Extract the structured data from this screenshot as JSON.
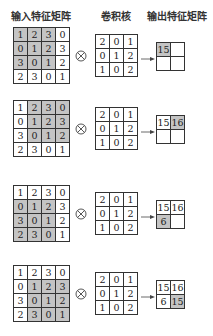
{
  "headers": {
    "input": "输入特征矩阵",
    "kernel": "卷积核",
    "output": "输出特征矩阵"
  },
  "colors": {
    "highlight": "#c4c4c4",
    "border": "#333333"
  },
  "operator_symbol": "⊗",
  "input_matrix": [
    [
      "1",
      "2",
      "3",
      "0"
    ],
    [
      "0",
      "1",
      "2",
      "3"
    ],
    [
      "3",
      "0",
      "1",
      "2"
    ],
    [
      "2",
      "3",
      "0",
      "1"
    ]
  ],
  "kernel_matrix": [
    [
      "2",
      "0",
      "1"
    ],
    [
      "0",
      "1",
      "2"
    ],
    [
      "1",
      "0",
      "2"
    ]
  ],
  "steps": [
    {
      "window_row": 0,
      "window_col": 0,
      "output": [
        [
          "15",
          ""
        ],
        [
          "",
          ""
        ]
      ],
      "output_highlight": [
        0,
        0
      ]
    },
    {
      "window_row": 0,
      "window_col": 1,
      "output": [
        [
          "15",
          "16"
        ],
        [
          "",
          ""
        ]
      ],
      "output_highlight": [
        0,
        1
      ]
    },
    {
      "window_row": 1,
      "window_col": 0,
      "output": [
        [
          "15",
          "16"
        ],
        [
          "6",
          ""
        ]
      ],
      "output_highlight": [
        1,
        0
      ]
    },
    {
      "window_row": 1,
      "window_col": 1,
      "output": [
        [
          "15",
          "16"
        ],
        [
          "6",
          "15"
        ]
      ],
      "output_highlight": [
        1,
        1
      ]
    }
  ]
}
